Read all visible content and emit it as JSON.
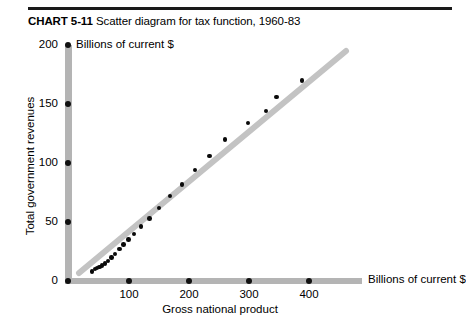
{
  "title": {
    "number": "CHART 5-11",
    "text": "Scatter diagram for tax function, 1960-83"
  },
  "chart_data": {
    "type": "scatter",
    "title": "CHART 5-11 Scatter diagram for tax function, 1960-83",
    "xlabel": "Gross national product",
    "ylabel": "Total government revenues",
    "x_units": "Billions of current $",
    "y_units": "Billions of current $",
    "xlim": [
      0,
      420
    ],
    "ylim": [
      0,
      200
    ],
    "xticks": [
      0,
      100,
      200,
      300,
      400
    ],
    "yticks": [
      0,
      50,
      100,
      150,
      200
    ],
    "grid": false,
    "legend": null,
    "series": [
      {
        "name": "Tax function observations, 1960-83",
        "points": [
          {
            "x": 40,
            "y": 8
          },
          {
            "x": 45,
            "y": 10
          },
          {
            "x": 49,
            "y": 11
          },
          {
            "x": 53,
            "y": 12
          },
          {
            "x": 57,
            "y": 13
          },
          {
            "x": 62,
            "y": 15
          },
          {
            "x": 67,
            "y": 17
          },
          {
            "x": 73,
            "y": 20
          },
          {
            "x": 79,
            "y": 23
          },
          {
            "x": 86,
            "y": 27
          },
          {
            "x": 93,
            "y": 31
          },
          {
            "x": 101,
            "y": 35
          },
          {
            "x": 110,
            "y": 40
          },
          {
            "x": 122,
            "y": 46
          },
          {
            "x": 136,
            "y": 53
          },
          {
            "x": 152,
            "y": 62
          },
          {
            "x": 170,
            "y": 72
          },
          {
            "x": 190,
            "y": 82
          },
          {
            "x": 212,
            "y": 94
          },
          {
            "x": 236,
            "y": 106
          },
          {
            "x": 262,
            "y": 120
          },
          {
            "x": 300,
            "y": 134
          },
          {
            "x": 330,
            "y": 144
          },
          {
            "x": 348,
            "y": 156
          },
          {
            "x": 390,
            "y": 170
          }
        ]
      }
    ],
    "trend_line": {
      "name": "fitted tax function",
      "color": "#c0c0c0",
      "x_start": 28,
      "y_start": 6,
      "x_end": 400,
      "y_end": 178
    }
  },
  "axes": {
    "y_units_label": "Billions of current $",
    "x_units_label": "Billions of current $",
    "y_axis_title": "Total government revenues",
    "x_axis_title": "Gross national product",
    "y_tick_labels": [
      "200",
      "150",
      "100",
      "50",
      "0"
    ],
    "x_tick_labels": [
      "100",
      "200",
      "300",
      "400"
    ]
  }
}
